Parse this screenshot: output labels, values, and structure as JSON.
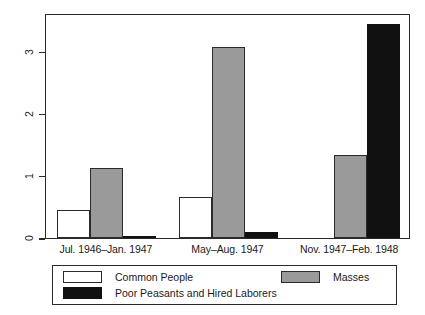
{
  "chart_data": {
    "type": "bar",
    "title": "",
    "subtitle": "",
    "xlabel": "",
    "ylabel": "Mentions per Page",
    "categories": [
      "Jul. 1946–Jan. 1947",
      "May–Aug. 1947",
      "Nov. 1947–Feb. 1948"
    ],
    "series": [
      {
        "name": "Common People",
        "color": "#ffffff",
        "values": [
          0.45,
          0.66,
          0.0
        ]
      },
      {
        "name": "Masses",
        "color": "#9a9a9a",
        "values": [
          1.13,
          3.08,
          1.33
        ]
      },
      {
        "name": "Poor Peasants and Hired Laborers",
        "color": "#111111",
        "values": [
          0.03,
          0.1,
          3.45
        ]
      }
    ],
    "ylim": [
      0,
      3.62
    ],
    "yticks": [
      0,
      1,
      2,
      3
    ],
    "ytick_labels": [
      "0",
      "1",
      "2",
      "3"
    ],
    "grid": false,
    "legend_position": "bottom",
    "legend_entries": [
      "Common People",
      "Masses",
      "Poor Peasants and Hired Laborers"
    ]
  },
  "axis": {
    "y_label": "Mentions per Page",
    "y_ticks": [
      "0",
      "1",
      "2",
      "3"
    ]
  },
  "legend": {
    "items": [
      {
        "label": "Common People"
      },
      {
        "label": "Masses"
      },
      {
        "label": "Poor Peasants and Hired Laborers"
      }
    ]
  }
}
